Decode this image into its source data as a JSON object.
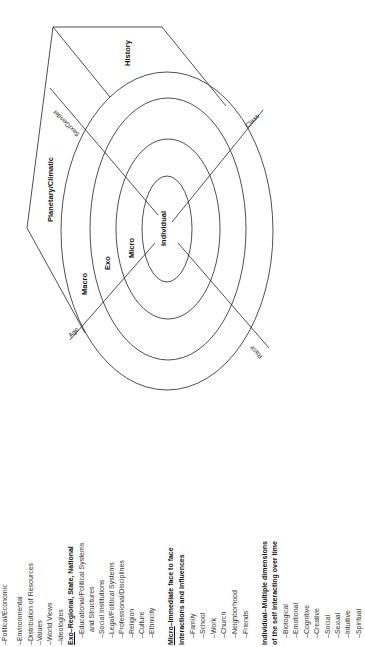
{
  "diagram": {
    "rings": {
      "individual": "Individual",
      "micro": "Micro",
      "exo": "Exo",
      "macro": "Macro",
      "planetary": "Planetary/Climatic",
      "history": "History"
    },
    "axes": {
      "age": "Age",
      "class": "Class",
      "sex_gender": "Sex/Gender",
      "race": "Race"
    }
  },
  "legend": {
    "macro_items": [
      "–Political/Economic",
      "–Environmental",
      "–Distribution of Resources",
      "–Values",
      "–World Views",
      "–Ideologies"
    ],
    "exo": {
      "heading_prefix": "Exo",
      "heading_rest": "–Regional, State, National",
      "items": [
        "–Educational/Political Systems",
        "and Structures",
        "–Social Institutions",
        "–Legal/Political Systems",
        "–Professional/Disciplines",
        "–Religion",
        "–Culture",
        "–Ethnicity"
      ]
    },
    "micro": {
      "heading_prefix": "Micro",
      "heading_line1_rest": "–Immediate face to face",
      "heading_line2": "interactions and influences",
      "items": [
        "–Family",
        "–School",
        "–Work",
        "–Church",
        "–Neighborhood",
        "–Friends"
      ]
    },
    "individual": {
      "heading_line1": "Individual–Multiple dimensions",
      "heading_line2": "of the self interacting over time",
      "items": [
        "–Biological",
        "–Emotional",
        "–Cognitive",
        "–Creative",
        "–Social",
        "–Sexual",
        "–Intuitive",
        "–Spiritual"
      ]
    }
  }
}
